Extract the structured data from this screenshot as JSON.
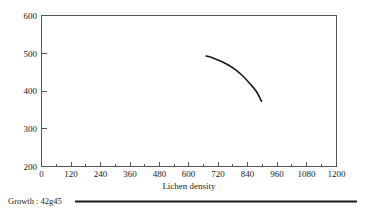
{
  "chart_data": {
    "type": "line",
    "title": "",
    "subtitle": "",
    "xlabel": "Lichen density",
    "ylabel": "",
    "xlim": [
      0,
      1200
    ],
    "ylim": [
      200,
      600
    ],
    "grid": false,
    "legend_position": "bottom-left",
    "x_ticks": [
      0,
      120,
      240,
      360,
      480,
      600,
      720,
      840,
      960,
      1080,
      1200
    ],
    "x_tick_labels": [
      "0",
      "120",
      "240",
      "360",
      "480",
      "600",
      "720",
      "840",
      "960",
      "1080",
      "1200"
    ],
    "x_minor_tick_step": 60,
    "y_ticks": [
      200,
      300,
      400,
      500,
      600
    ],
    "y_tick_labels": [
      "200",
      "300",
      "400",
      "500",
      "600"
    ],
    "series": [
      {
        "name": "Growth : 42g45",
        "color": "#1a1a1a",
        "x": [
          670,
          700,
          730,
          760,
          790,
          820,
          850,
          875,
          895
        ],
        "y": [
          493,
          487,
          479,
          469,
          456,
          439,
          418,
          398,
          373
        ]
      }
    ],
    "legend": [
      {
        "label": "Growth : 42g45",
        "color": "#1a1a1a"
      }
    ]
  },
  "figure": {
    "axis_title_x": "Lichen density",
    "legend_entry_label": "Growth : 42g45"
  }
}
